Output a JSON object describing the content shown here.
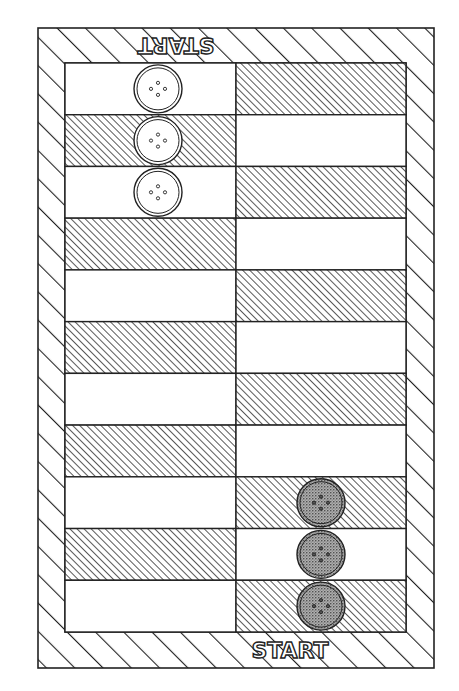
{
  "game": {
    "title": "Button race board",
    "columns": 2,
    "rows": 11
  },
  "labels": {
    "start_top": "START",
    "start_bottom": "START"
  },
  "colors": {
    "line": "#222222",
    "background": "#ffffff",
    "light_piece_fill": "#ffffff",
    "dark_piece_fill": "#8a8a8a"
  },
  "board": {
    "left_column_pattern": [
      "white",
      "hatch",
      "white",
      "hatch",
      "white",
      "hatch",
      "white",
      "hatch",
      "white",
      "hatch",
      "white"
    ],
    "right_column_pattern": [
      "hatch",
      "white",
      "hatch",
      "white",
      "hatch",
      "white",
      "hatch",
      "white",
      "hatch",
      "white",
      "hatch"
    ]
  },
  "pieces": {
    "light": [
      {
        "column": "left",
        "row": 1
      },
      {
        "column": "left",
        "row": 2
      },
      {
        "column": "left",
        "row": 3
      }
    ],
    "dark": [
      {
        "column": "right",
        "row": 9
      },
      {
        "column": "right",
        "row": 10
      },
      {
        "column": "right",
        "row": 11
      }
    ]
  }
}
